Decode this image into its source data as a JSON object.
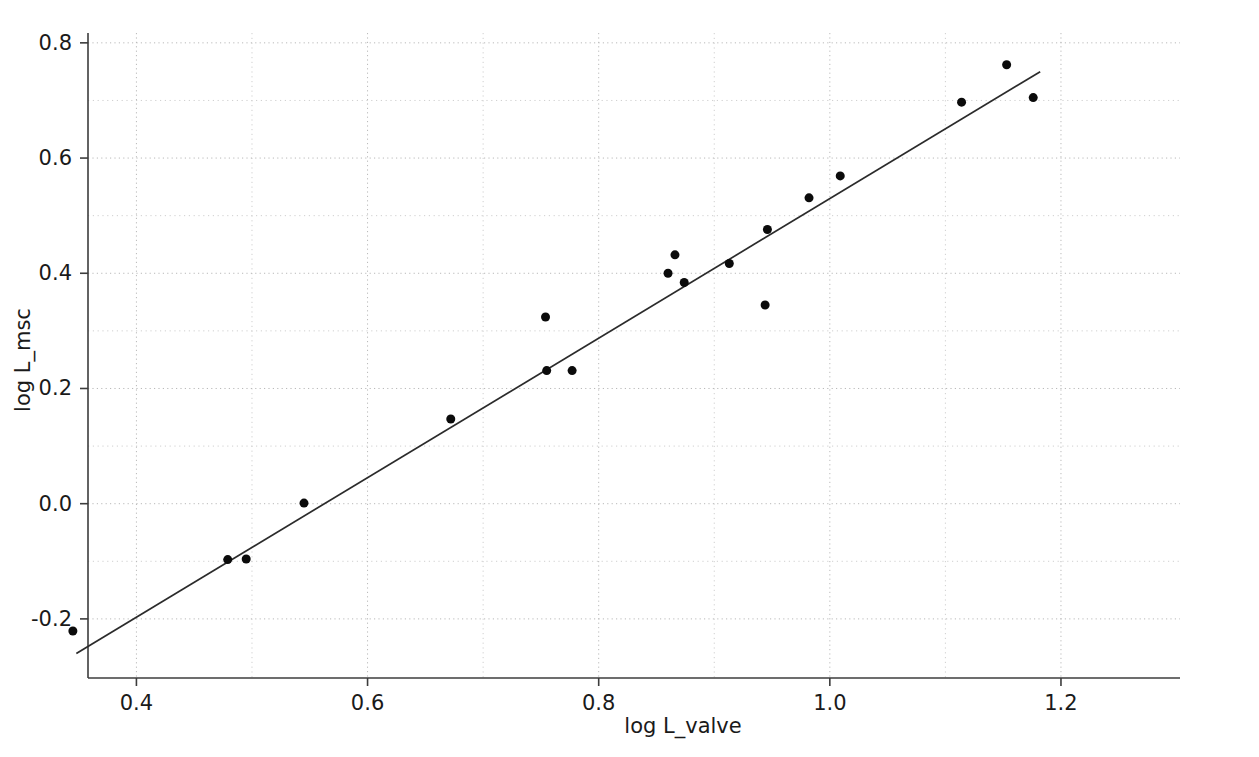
{
  "chart_data": {
    "type": "scatter",
    "title": "",
    "xlabel": "log L_valve",
    "ylabel": "log L_msc",
    "xlim": [
      0.3581,
      1.303
    ],
    "ylim": [
      -0.3026,
      0.8171
    ],
    "grid": true,
    "legend": "none",
    "x_ticks": [
      0.4,
      0.6,
      0.8,
      1.0,
      1.2
    ],
    "x_tick_labels": [
      "0.4",
      "0.6",
      "0.8",
      "1.0",
      "1.2"
    ],
    "y_ticks": [
      -0.2,
      0.0,
      0.2,
      0.4,
      0.6,
      0.8
    ],
    "y_tick_labels": [
      "-0.2",
      "0.0",
      "0.2",
      "0.4",
      "0.6",
      "0.8"
    ],
    "x_minor_ticks": [
      0.5,
      0.7,
      0.9,
      1.1
    ],
    "y_minor_ticks": [
      -0.1,
      0.1,
      0.3,
      0.5,
      0.7
    ],
    "marker": "circle",
    "marker_color": "#0b0b0b",
    "marker_size": 9,
    "line_color": "#2b2b2b",
    "points": [
      {
        "x": 0.345,
        "y": -0.221
      },
      {
        "x": 0.479,
        "y": -0.097
      },
      {
        "x": 0.495,
        "y": -0.096
      },
      {
        "x": 0.545,
        "y": 0.001
      },
      {
        "x": 0.672,
        "y": 0.147
      },
      {
        "x": 0.754,
        "y": 0.324
      },
      {
        "x": 0.755,
        "y": 0.231
      },
      {
        "x": 0.777,
        "y": 0.231
      },
      {
        "x": 0.86,
        "y": 0.4
      },
      {
        "x": 0.866,
        "y": 0.432
      },
      {
        "x": 0.874,
        "y": 0.384
      },
      {
        "x": 0.913,
        "y": 0.417
      },
      {
        "x": 0.944,
        "y": 0.345
      },
      {
        "x": 0.946,
        "y": 0.476
      },
      {
        "x": 0.982,
        "y": 0.531
      },
      {
        "x": 1.009,
        "y": 0.569
      },
      {
        "x": 1.114,
        "y": 0.697
      },
      {
        "x": 1.153,
        "y": 0.762
      },
      {
        "x": 1.176,
        "y": 0.705
      }
    ],
    "fit_line": {
      "label": "linear-fit",
      "x_start": 0.348,
      "y_start": -0.26,
      "x_end": 1.182,
      "y_end": 0.75
    }
  }
}
